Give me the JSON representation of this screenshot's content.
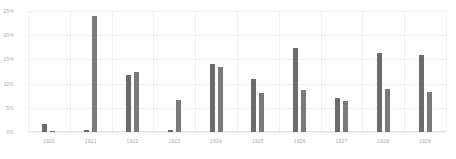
{
  "chart_data": {
    "type": "bar",
    "title": "",
    "subtitle": "",
    "xlabel": "",
    "ylabel": "",
    "categories": [
      "1920",
      "1921",
      "1922",
      "1923",
      "1924",
      "1925",
      "1926",
      "1927",
      "1928",
      "1929"
    ],
    "series": [
      {
        "name": "Series 1",
        "color": "#6b6b6b",
        "values": [
          1.6,
          0.5,
          11.8,
          0.5,
          14.1,
          11.0,
          17.4,
          7.0,
          16.3,
          16.0
        ]
      },
      {
        "name": "Series 2",
        "color": "#7a7a7a",
        "values": [
          0.2,
          24.0,
          12.5,
          6.6,
          13.5,
          8.0,
          8.6,
          6.4,
          8.8,
          8.2
        ]
      }
    ],
    "ylim": [
      0,
      25
    ],
    "yticks": [
      0,
      5,
      10,
      15,
      20,
      25
    ],
    "ytick_labels": [
      "0%",
      "5%",
      "10%",
      "15%",
      "20%",
      "25%"
    ],
    "grid": true,
    "vertical_grid": true,
    "legend": false,
    "legend_position": "none",
    "annotations": []
  },
  "colors": {
    "background": "#ffffff",
    "gridline": "#f0f0f0",
    "axis": "#e2e2e2",
    "tick_text": "#a9a9a9",
    "series1": "#6b6b6b",
    "series2": "#7a7a7a"
  }
}
